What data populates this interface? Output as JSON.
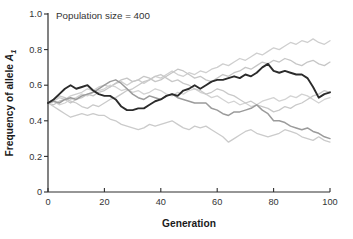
{
  "figure": {
    "annotation": "Population size = 400",
    "x_label": "Generation",
    "y_label_main": "Frequency of allele",
    "y_label_var": "A",
    "y_label_sub": "1"
  },
  "colors": {
    "axis": "#2e2e2e",
    "text": "#333333",
    "highlight_line": "#2b2b2b",
    "medium_line": "#9b9b9b",
    "light_line": "#cdcdcd",
    "background": "#ffffff"
  },
  "chart_data": {
    "type": "line",
    "title": "Population size = 400",
    "xlabel": "Generation",
    "ylabel": "Frequency of allele A1",
    "xlim": [
      0,
      100
    ],
    "ylim": [
      0,
      1
    ],
    "grid": false,
    "legend": "none",
    "x_ticks": [
      {
        "value": 0,
        "label": "0"
      },
      {
        "value": 20,
        "label": "20"
      },
      {
        "value": 40,
        "label": "40"
      },
      {
        "value": 60,
        "label": "60"
      },
      {
        "value": 80,
        "label": "80"
      },
      {
        "value": 100,
        "label": "100"
      }
    ],
    "y_ticks": [
      {
        "value": 0,
        "label": "0"
      },
      {
        "value": 0.2,
        "label": "0.2"
      },
      {
        "value": 0.4,
        "label": "0.4"
      },
      {
        "value": 0.6,
        "label": "0.6"
      },
      {
        "value": 0.8,
        "label": "0.8"
      },
      {
        "value": 1.0,
        "label": "1.0"
      }
    ],
    "x_start": 0,
    "x_step": 2,
    "series": [
      {
        "name": "replicate-light-1",
        "color": "#cfcfcf",
        "width": 1.3,
        "values": [
          0.5,
          0.51,
          0.53,
          0.52,
          0.54,
          0.55,
          0.56,
          0.58,
          0.57,
          0.59,
          0.6,
          0.59,
          0.61,
          0.62,
          0.6,
          0.62,
          0.63,
          0.61,
          0.63,
          0.65,
          0.64,
          0.66,
          0.68,
          0.66,
          0.65,
          0.67,
          0.66,
          0.68,
          0.67,
          0.69,
          0.7,
          0.72,
          0.71,
          0.73,
          0.75,
          0.74,
          0.76,
          0.78,
          0.77,
          0.79,
          0.81,
          0.8,
          0.82,
          0.84,
          0.83,
          0.85,
          0.84,
          0.86,
          0.84,
          0.83,
          0.85
        ]
      },
      {
        "name": "replicate-light-2",
        "color": "#c6c6c6",
        "width": 1.3,
        "values": [
          0.5,
          0.49,
          0.51,
          0.52,
          0.5,
          0.52,
          0.53,
          0.55,
          0.54,
          0.56,
          0.57,
          0.59,
          0.61,
          0.63,
          0.64,
          0.62,
          0.63,
          0.65,
          0.64,
          0.62,
          0.63,
          0.65,
          0.67,
          0.69,
          0.68,
          0.66,
          0.64,
          0.65,
          0.63,
          0.62,
          0.64,
          0.66,
          0.65,
          0.67,
          0.68,
          0.7,
          0.69,
          0.71,
          0.73,
          0.72,
          0.74,
          0.73,
          0.75,
          0.74,
          0.72,
          0.71,
          0.73,
          0.74,
          0.72,
          0.71,
          0.73
        ]
      },
      {
        "name": "replicate-light-3",
        "color": "#d3d3d3",
        "width": 1.3,
        "values": [
          0.5,
          0.51,
          0.49,
          0.5,
          0.52,
          0.53,
          0.55,
          0.54,
          0.56,
          0.57,
          0.58,
          0.6,
          0.59,
          0.57,
          0.58,
          0.56,
          0.57,
          0.55,
          0.56,
          0.58,
          0.57,
          0.55,
          0.54,
          0.56,
          0.55,
          0.57,
          0.58,
          0.56,
          0.55,
          0.53,
          0.54,
          0.52,
          0.5,
          0.51,
          0.49,
          0.5,
          0.48,
          0.49,
          0.51,
          0.52,
          0.53,
          0.51,
          0.52,
          0.54,
          0.53,
          0.55,
          0.54,
          0.52,
          0.5,
          0.52,
          0.53
        ]
      },
      {
        "name": "replicate-light-4",
        "color": "#cbcbcb",
        "width": 1.3,
        "values": [
          0.5,
          0.48,
          0.46,
          0.44,
          0.42,
          0.43,
          0.44,
          0.43,
          0.44,
          0.43,
          0.43,
          0.41,
          0.4,
          0.38,
          0.37,
          0.36,
          0.35,
          0.36,
          0.38,
          0.37,
          0.38,
          0.39,
          0.4,
          0.38,
          0.36,
          0.35,
          0.37,
          0.36,
          0.37,
          0.35,
          0.33,
          0.31,
          0.28,
          0.3,
          0.32,
          0.34,
          0.35,
          0.33,
          0.32,
          0.31,
          0.32,
          0.33,
          0.35,
          0.34,
          0.33,
          0.31,
          0.3,
          0.29,
          0.31,
          0.29,
          0.28
        ]
      },
      {
        "name": "replicate-light-5",
        "color": "#c9c9c9",
        "width": 1.3,
        "values": [
          0.5,
          0.52,
          0.54,
          0.53,
          0.51,
          0.5,
          0.48,
          0.47,
          0.49,
          0.48,
          0.5,
          0.52,
          0.53,
          0.55,
          0.57,
          0.58,
          0.6,
          0.62,
          0.63,
          0.65,
          0.66,
          0.64,
          0.62,
          0.63,
          0.61,
          0.6,
          0.58,
          0.57,
          0.55,
          0.56,
          0.58,
          0.57,
          0.55,
          0.54,
          0.52,
          0.5,
          0.51,
          0.49,
          0.48,
          0.47,
          0.45,
          0.46,
          0.48,
          0.47,
          0.49,
          0.5,
          0.52,
          0.54,
          0.55,
          0.57,
          0.56
        ]
      },
      {
        "name": "replicate-medium",
        "color": "#9b9b9b",
        "width": 1.5,
        "values": [
          0.5,
          0.51,
          0.5,
          0.52,
          0.53,
          0.52,
          0.54,
          0.55,
          0.56,
          0.58,
          0.6,
          0.62,
          0.63,
          0.61,
          0.58,
          0.55,
          0.53,
          0.52,
          0.54,
          0.53,
          0.52,
          0.54,
          0.55,
          0.53,
          0.52,
          0.51,
          0.5,
          0.5,
          0.5,
          0.47,
          0.46,
          0.44,
          0.43,
          0.45,
          0.45,
          0.46,
          0.47,
          0.49,
          0.46,
          0.44,
          0.4,
          0.4,
          0.39,
          0.37,
          0.36,
          0.35,
          0.36,
          0.34,
          0.33,
          0.31,
          0.3
        ]
      },
      {
        "name": "replicate-highlight",
        "color": "#2b2b2b",
        "width": 1.9,
        "values": [
          0.5,
          0.52,
          0.55,
          0.58,
          0.6,
          0.58,
          0.59,
          0.6,
          0.57,
          0.55,
          0.54,
          0.54,
          0.52,
          0.48,
          0.46,
          0.46,
          0.47,
          0.47,
          0.49,
          0.51,
          0.52,
          0.54,
          0.55,
          0.54,
          0.57,
          0.58,
          0.6,
          0.58,
          0.6,
          0.62,
          0.63,
          0.63,
          0.64,
          0.65,
          0.64,
          0.66,
          0.65,
          0.67,
          0.7,
          0.72,
          0.68,
          0.67,
          0.68,
          0.67,
          0.66,
          0.66,
          0.64,
          0.59,
          0.53,
          0.55,
          0.56
        ]
      }
    ]
  },
  "layout": {
    "plot": {
      "left": 48,
      "right": 330,
      "top": 14,
      "bottom": 192
    }
  }
}
